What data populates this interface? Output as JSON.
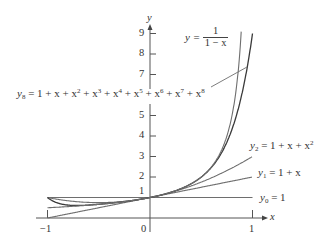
{
  "chart_data": {
    "type": "line",
    "title": "",
    "xlabel": "x",
    "ylabel": "y",
    "xlim": [
      -1,
      1
    ],
    "ylim": [
      0,
      9
    ],
    "grid": false,
    "x_ticks": [
      {
        "value": -1,
        "label": "-1"
      },
      {
        "value": 0,
        "label": "0"
      },
      {
        "value": 1,
        "label": "1"
      }
    ],
    "y_ticks": [
      {
        "value": 1,
        "label": "1"
      },
      {
        "value": 2,
        "label": "2"
      },
      {
        "value": 3,
        "label": "3"
      },
      {
        "value": 4,
        "label": "4"
      },
      {
        "value": 5,
        "label": "5"
      },
      {
        "value": 7,
        "label": "7"
      },
      {
        "value": 8,
        "label": "8"
      },
      {
        "value": 9,
        "label": "9"
      }
    ],
    "x": [
      -1,
      -0.9,
      -0.8,
      -0.7,
      -0.6,
      -0.5,
      -0.4,
      -0.3,
      -0.2,
      -0.1,
      0,
      0.1,
      0.2,
      0.3,
      0.4,
      0.5,
      0.6,
      0.7,
      0.8,
      0.9,
      1.0
    ],
    "series": [
      {
        "name": "y0 = 1",
        "values": [
          1,
          1,
          1,
          1,
          1,
          1,
          1,
          1,
          1,
          1,
          1,
          1,
          1,
          1,
          1,
          1,
          1,
          1,
          1,
          1,
          1
        ]
      },
      {
        "name": "y1 = 1 + x",
        "values": [
          0,
          0.1,
          0.2,
          0.3,
          0.4,
          0.5,
          0.6,
          0.7,
          0.8,
          0.9,
          1,
          1.1,
          1.2,
          1.3,
          1.4,
          1.5,
          1.6,
          1.7,
          1.8,
          1.9,
          2
        ]
      },
      {
        "name": "y2 = 1 + x + x^2",
        "values": [
          1,
          0.91,
          0.84,
          0.79,
          0.76,
          0.75,
          0.76,
          0.79,
          0.84,
          0.91,
          1,
          1.11,
          1.24,
          1.39,
          1.56,
          1.75,
          1.96,
          2.19,
          2.44,
          2.71,
          3
        ]
      },
      {
        "name": "y8 = 1 + x + x^2 + x^3 + x^4 + x^5 + x^6 + x^7 + x^8",
        "values": [
          1,
          0.73,
          0.63,
          0.612,
          0.631,
          0.668,
          0.715,
          0.769,
          0.833,
          0.909,
          1,
          1.111,
          1.25,
          1.429,
          1.666,
          1.996,
          2.475,
          3.199,
          4.329,
          6.126,
          9
        ]
      },
      {
        "name": "y = 1/(1 - x)",
        "values": [
          0.5,
          0.526,
          0.556,
          0.588,
          0.625,
          0.667,
          0.714,
          0.769,
          0.833,
          0.909,
          1,
          1.111,
          1.25,
          1.429,
          1.667,
          2,
          2.5,
          3.333,
          5,
          10,
          null
        ]
      }
    ],
    "annotations": [
      {
        "text": "y = 1/(1 - x)",
        "position": "top-right, near x=0.5, y=9"
      },
      {
        "text": "y8 = 1 + x + x^2 + x^3 + x^4 + x^5 + x^6 + x^7 + x^8",
        "position": "left, y≈6, with leader line to y8 curve near x=0.95"
      },
      {
        "text": "y2 = 1 + x + x^2",
        "position": "right of y2 end"
      },
      {
        "text": "y1 = 1 + x",
        "position": "right of y1 end"
      },
      {
        "text": "y0 = 1",
        "position": "right of y0 end"
      }
    ]
  },
  "axes": {
    "x_label": "x",
    "y_label": "y",
    "origin_label": "0",
    "x_tick_labels": [
      "−1",
      "1"
    ],
    "y_tick_labels": [
      "1",
      "2",
      "3",
      "4",
      "5",
      "7",
      "8",
      "9"
    ]
  },
  "labels": {
    "recip": {
      "lhs": "y =",
      "num": "1",
      "den": "1 − x"
    },
    "y8": {
      "y": "y",
      "sub": "8",
      "rhs_prefix": "= 1 + x + x",
      "terms": [
        "2",
        "3",
        "4",
        "5",
        "6",
        "7",
        "8"
      ]
    },
    "y2": {
      "y": "y",
      "sub": "2",
      "rhs": "= 1 + x + x",
      "sup": "2"
    },
    "y1": {
      "y": "y",
      "sub": "1",
      "rhs": "= 1 + x"
    },
    "y0": {
      "y": "y",
      "sub": "0",
      "rhs": "= 1"
    }
  },
  "colors": {
    "curve": "#6e6e6e",
    "axis": "#555555",
    "text": "#333333"
  }
}
